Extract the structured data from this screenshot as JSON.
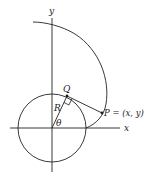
{
  "diagram": {
    "type": "involute of a circle",
    "labels": {
      "y_axis": "y",
      "x_axis": "x",
      "Q": "Q",
      "R": "R",
      "theta": "θ",
      "P": "P = (x, y)"
    },
    "colors": {
      "stroke": "#222222",
      "background": "#ffffff"
    }
  }
}
